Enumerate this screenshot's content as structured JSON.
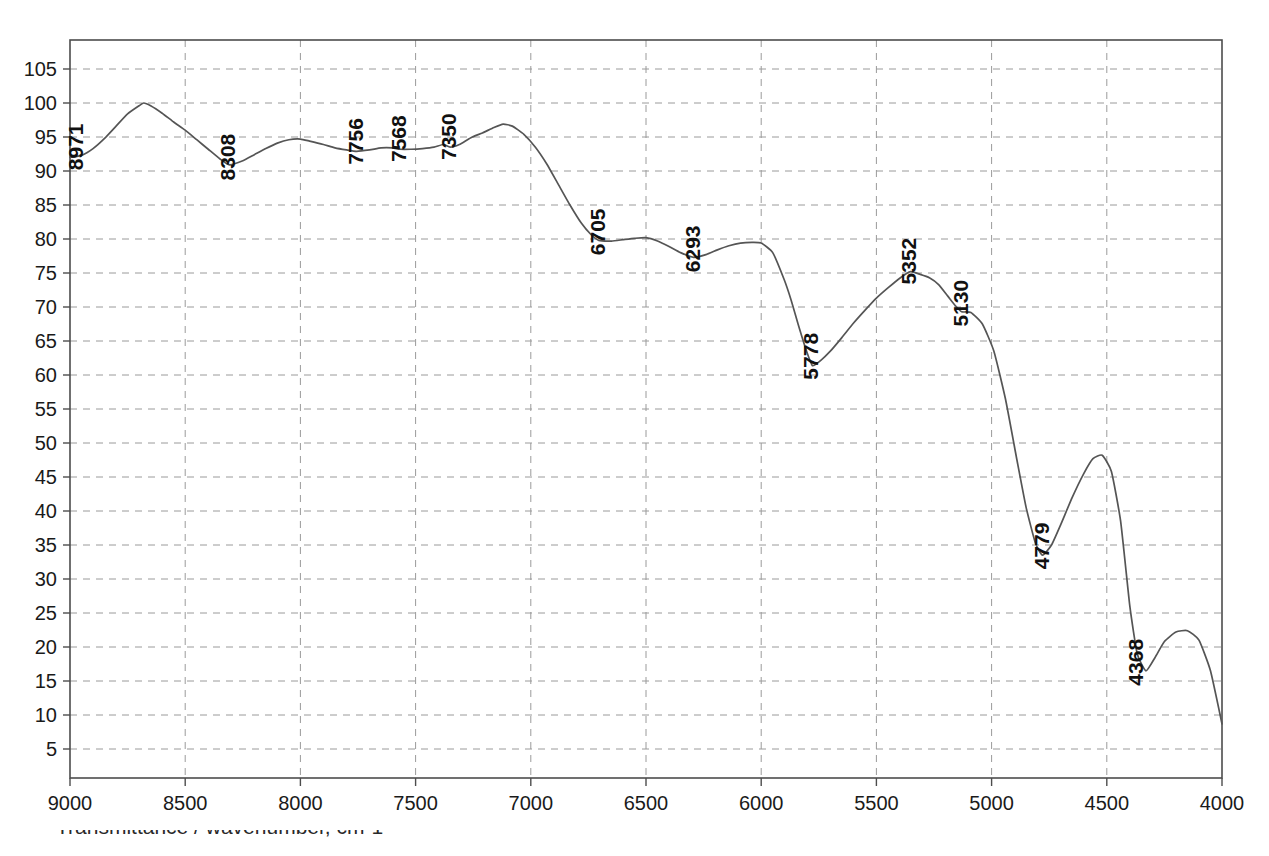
{
  "chart_data": {
    "type": "line",
    "title": "",
    "subtitle": "",
    "xlabel": "",
    "ylabel": "",
    "xlim": [
      9000,
      4000
    ],
    "ylim": [
      0,
      108
    ],
    "x_axis_reversed": true,
    "grid": true,
    "legend_position": "none",
    "x_ticks": [
      9000,
      8500,
      8000,
      7500,
      7000,
      6500,
      6000,
      5500,
      5000,
      4500,
      4000
    ],
    "y_ticks": [
      5,
      10,
      15,
      20,
      25,
      30,
      35,
      40,
      45,
      50,
      55,
      60,
      65,
      70,
      75,
      80,
      85,
      90,
      95,
      100,
      105
    ],
    "series": [
      {
        "name": "transmittance",
        "color": "#555555",
        "x": [
          9000,
          8950,
          8900,
          8850,
          8800,
          8750,
          8700,
          8680,
          8650,
          8600,
          8550,
          8500,
          8450,
          8400,
          8350,
          8308,
          8250,
          8200,
          8150,
          8100,
          8050,
          8000,
          7960,
          7900,
          7850,
          7800,
          7756,
          7700,
          7650,
          7600,
          7568,
          7520,
          7470,
          7420,
          7380,
          7350,
          7310,
          7260,
          7210,
          7160,
          7120,
          7080,
          7030,
          6980,
          6930,
          6880,
          6830,
          6780,
          6740,
          6705,
          6650,
          6600,
          6550,
          6500,
          6450,
          6400,
          6350,
          6293,
          6240,
          6190,
          6140,
          6090,
          6040,
          6000,
          5950,
          5900,
          5870,
          5840,
          5810,
          5778,
          5740,
          5700,
          5650,
          5600,
          5550,
          5500,
          5450,
          5400,
          5352,
          5310,
          5270,
          5230,
          5190,
          5160,
          5130,
          5090,
          5040,
          4990,
          4940,
          4890,
          4850,
          4810,
          4779,
          4740,
          4700,
          4650,
          4600,
          4560,
          4520,
          4480,
          4440,
          4400,
          4368,
          4330,
          4290,
          4250,
          4200,
          4150,
          4100,
          4050,
          4000
        ],
        "y": [
          92.0,
          92.3,
          93.3,
          94.8,
          96.6,
          98.4,
          99.6,
          100.0,
          99.6,
          98.5,
          97.2,
          96.0,
          94.6,
          93.2,
          91.8,
          90.9,
          91.5,
          92.4,
          93.3,
          94.1,
          94.6,
          94.7,
          94.4,
          93.9,
          93.4,
          93.1,
          92.9,
          93.1,
          93.4,
          93.4,
          93.2,
          93.2,
          93.3,
          93.5,
          93.9,
          93.5,
          93.9,
          94.9,
          95.6,
          96.4,
          96.9,
          96.6,
          95.4,
          93.5,
          91.0,
          88.0,
          85.0,
          82.3,
          80.7,
          79.8,
          79.7,
          79.9,
          80.1,
          80.2,
          79.7,
          78.9,
          78.0,
          77.3,
          77.7,
          78.4,
          79.0,
          79.4,
          79.5,
          79.4,
          78.0,
          74.0,
          71.0,
          67.5,
          64.2,
          61.4,
          62.2,
          63.5,
          65.5,
          67.6,
          69.5,
          71.3,
          72.8,
          74.2,
          75.2,
          74.8,
          74.3,
          73.3,
          71.6,
          70.3,
          69.3,
          69.2,
          67.5,
          63.5,
          56.5,
          47.5,
          40.5,
          35.3,
          33.5,
          35.0,
          38.0,
          42.0,
          45.5,
          47.7,
          48.2,
          45.8,
          38.5,
          26.0,
          19.0,
          16.5,
          18.5,
          20.8,
          22.2,
          22.4,
          21.0,
          16.5,
          8.7
        ]
      }
    ],
    "peak_labels": [
      {
        "label": "8971",
        "x": 8971,
        "y": 91.0
      },
      {
        "label": "8308",
        "x": 8308,
        "y": 89.5
      },
      {
        "label": "7756",
        "x": 7756,
        "y": 91.8
      },
      {
        "label": "7568",
        "x": 7568,
        "y": 92.2
      },
      {
        "label": "7350",
        "x": 7350,
        "y": 92.5
      },
      {
        "label": "6705",
        "x": 6705,
        "y": 78.5
      },
      {
        "label": "6293",
        "x": 6293,
        "y": 76.0
      },
      {
        "label": "5778",
        "x": 5778,
        "y": 60.2
      },
      {
        "label": "5352",
        "x": 5352,
        "y": 74.2
      },
      {
        "label": "5130",
        "x": 5130,
        "y": 68.0
      },
      {
        "label": "4779",
        "x": 4779,
        "y": 32.3
      },
      {
        "label": "4368",
        "x": 4368,
        "y": 15.2
      }
    ],
    "footer_note": "Transmittance / wavenumber, cm-1"
  },
  "axis": {
    "x_tick_labels": [
      "9000",
      "8500",
      "8000",
      "7500",
      "7000",
      "6500",
      "6000",
      "5500",
      "5000",
      "4500",
      "4000"
    ],
    "y_tick_labels": [
      "105",
      "100",
      "95",
      "90",
      "85",
      "80",
      "75",
      "70",
      "65",
      "60",
      "55",
      "50",
      "45",
      "40",
      "35",
      "30",
      "25",
      "20",
      "15",
      "10",
      "5"
    ]
  },
  "colors": {
    "trace": "#555555",
    "grid": "#9a9a9a",
    "frame": "#4d4d4d",
    "text": "#1a1a1a",
    "background": "#ffffff"
  }
}
